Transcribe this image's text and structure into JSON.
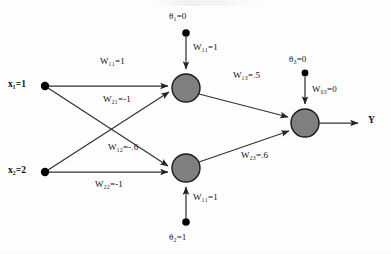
{
  "diagram": {
    "colors": {
      "node_fill": "#808080",
      "node_stroke": "#1a1a1a",
      "edge": "#333333",
      "bias_dot": "#000000",
      "background": "#ffffff",
      "text": "#111111"
    },
    "inputs": [
      {
        "id": "x1",
        "label": "x",
        "subscript": "1",
        "value": "=1",
        "text": "x₁=1",
        "cx": 45,
        "cy": 86
      },
      {
        "id": "x2",
        "label": "x",
        "subscript": "2",
        "value": "=2",
        "text": "x₂=2",
        "cx": 45,
        "cy": 172
      }
    ],
    "hidden_nodes": [
      {
        "id": "h1",
        "cx": 186,
        "cy": 88,
        "r": 14
      },
      {
        "id": "h2",
        "cx": 186,
        "cy": 168,
        "r": 14
      }
    ],
    "output_node": {
      "id": "o3",
      "cx": 305,
      "cy": 123,
      "r": 14
    },
    "output_label": {
      "text": "Y",
      "x": 368,
      "y": 118
    },
    "biases": [
      {
        "id": "theta1",
        "label": "θ",
        "subscript": "1",
        "value": "=0",
        "text": "θ₁=0",
        "dot_x": 186,
        "dot_y": 33
      },
      {
        "id": "theta2",
        "label": "θ",
        "subscript": "2",
        "value": "=1",
        "text": "θ₂=1",
        "dot_x": 186,
        "dot_y": 222
      },
      {
        "id": "theta3",
        "label": "θ",
        "subscript": "3",
        "value": "=0",
        "text": "θ₃=0",
        "dot_x": 305,
        "dot_y": 73
      }
    ],
    "weights": [
      {
        "id": "w11_input",
        "label": "W",
        "subscript": "11",
        "value": "=1",
        "text": "W₁₁=1",
        "x": 100,
        "y": 62,
        "from": "x1",
        "to": "h1"
      },
      {
        "id": "w21_input",
        "label": "W",
        "subscript": "21",
        "value": "=-1",
        "text": "W₂₁=-1",
        "x": 106,
        "y": 97,
        "from": "x2",
        "to": "h1"
      },
      {
        "id": "w12_input",
        "label": "W",
        "subscript": "12",
        "value": "=-.6",
        "text": "W₁₂=-.6",
        "x": 110,
        "y": 148,
        "from": "x1",
        "to": "h2"
      },
      {
        "id": "w22_input",
        "label": "W",
        "subscript": "22",
        "value": "=-1",
        "text": "W₂₂=-1",
        "x": 97,
        "y": 184,
        "from": "x2",
        "to": "h2"
      },
      {
        "id": "w11_bias_top",
        "label": "W",
        "subscript": "11",
        "value": "=1",
        "text": "W₁₁=1",
        "x": 193,
        "y": 50,
        "from": "theta1",
        "to": "h1"
      },
      {
        "id": "w11_bias_bottom",
        "label": "W",
        "subscript": "11",
        "value": "=1",
        "text": "W₁₁=1",
        "x": 193,
        "y": 197,
        "from": "theta2",
        "to": "h2"
      },
      {
        "id": "w13_output",
        "label": "W",
        "subscript": "13",
        "value": "=.5",
        "text": "W₁₃=.5",
        "x": 235,
        "y": 76,
        "from": "h1",
        "to": "o3"
      },
      {
        "id": "w23_output",
        "label": "W",
        "subscript": "23",
        "value": "=.6",
        "text": "W₂₃=.6",
        "x": 243,
        "y": 155,
        "from": "h2",
        "to": "o3"
      },
      {
        "id": "w03_bias",
        "label": "W",
        "subscript": "03",
        "value": "=0",
        "text": "W₀₃=0",
        "x": 312,
        "y": 90,
        "from": "theta3",
        "to": "o3"
      }
    ]
  }
}
